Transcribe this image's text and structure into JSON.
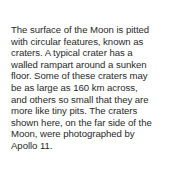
{
  "document": {
    "paragraph_lines": [
      "The surface of the Moon is pitted",
      "with circular features, known as",
      "craters. A typical crater has a",
      "walled rampart around a sunken",
      "floor. Some of these craters may",
      "be as large as 160 km across,",
      "and others so small that they are",
      "more like tiny pits. The craters",
      "shown here, on the far side of the",
      "Moon, were photographed by",
      "Apollo 11."
    ]
  }
}
